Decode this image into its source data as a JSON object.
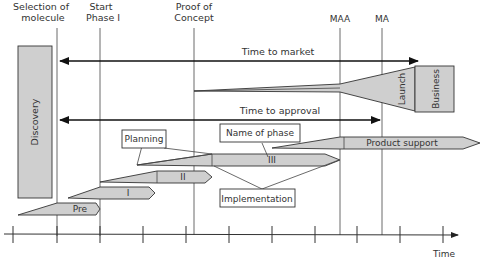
{
  "diagram": {
    "milestones": [
      {
        "id": "selection",
        "line1": "Selection of",
        "line2": "molecule"
      },
      {
        "id": "start_phase_1",
        "line1": "Start",
        "line2": "Phase I"
      },
      {
        "id": "proof_of_concept",
        "line1": "Proof of",
        "line2": "Concept"
      },
      {
        "id": "maa",
        "line1": "MAA"
      },
      {
        "id": "ma",
        "line1": "MA"
      }
    ],
    "arrows": {
      "time_to_market": "Time to market",
      "time_to_approval": "Time to approval"
    },
    "blocks": {
      "discovery": "Discovery",
      "launch": "Launch",
      "business": "Business"
    },
    "phases": [
      {
        "id": "pre",
        "label": "Pre"
      },
      {
        "id": "phase1",
        "label": "I"
      },
      {
        "id": "phase2",
        "label": "II"
      },
      {
        "id": "phase3",
        "label": "III"
      },
      {
        "id": "product_support",
        "label": "Product support"
      }
    ],
    "callouts": {
      "planning": "Planning",
      "name_of_phase": "Name of phase",
      "implementation": "Implementation"
    },
    "axis": {
      "label": "Time",
      "tick_count": 11
    }
  }
}
